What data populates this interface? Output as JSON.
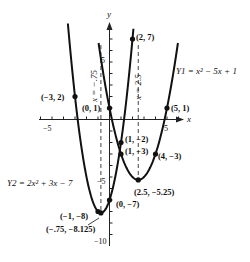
{
  "chart_data": {
    "type": "line",
    "title": "",
    "xlabel": "x",
    "ylabel": "y",
    "xlim": [
      -6,
      6
    ],
    "ylim": [
      -11,
      8.5
    ],
    "grid": false,
    "tick_labels": {
      "x": [
        {
          "value": -5,
          "label": "-5"
        },
        {
          "value": 5,
          "label": "5"
        }
      ],
      "y": [
        {
          "value": 5,
          "label": "5"
        },
        {
          "value": -5,
          "label": "-5"
        },
        {
          "value": -10,
          "label": "-10"
        }
      ]
    },
    "series": [
      {
        "name": "Y1 = x² − 5x + 1",
        "label_text": "Y1 = x² − 5x + 1",
        "formula": {
          "a": 1,
          "b": -5,
          "c": 1
        },
        "x_range": [
          -0.95,
          5.95
        ],
        "vertex": {
          "x": 2.5,
          "y": -5.25
        },
        "axis_of_symmetry": "x = 2.5"
      },
      {
        "name": "Y2 = 2x² + 3x − 7",
        "label_text": "Y2 = 2x² + 3x − 7",
        "formula": {
          "a": 2,
          "b": 3,
          "c": -7
        },
        "x_range": [
          -3.62,
          2.08
        ],
        "vertex": {
          "x": -0.75,
          "y": -8.125
        },
        "axis_of_symmetry": "x = −.75"
      }
    ],
    "points": [
      {
        "x": -3,
        "y": 2,
        "label": "(−3, 2)"
      },
      {
        "x": 0,
        "y": 1,
        "label": "(0, 1)"
      },
      {
        "x": 2,
        "y": 7,
        "label": "(2, 7)"
      },
      {
        "x": 5,
        "y": 1,
        "label": "(5, 1)"
      },
      {
        "x": 1,
        "y": -2,
        "label": "(1, −2)"
      },
      {
        "x": 1,
        "y": -3,
        "label": "(1, −3)"
      },
      {
        "x": 4,
        "y": -3,
        "label": "(4, −3)"
      },
      {
        "x": 2.5,
        "y": -5.25,
        "label": "(2.5, −5.25)"
      },
      {
        "x": 0,
        "y": -7,
        "label": "(0, −7)"
      },
      {
        "x": -1,
        "y": -8,
        "label": "(−1, −8)"
      },
      {
        "x": -0.75,
        "y": -8.125,
        "label": "(−.75, −8.125)"
      }
    ],
    "dashed_lines": [
      {
        "x": -0.75,
        "label": "x = −.75"
      },
      {
        "x": 2.5,
        "label": "x = 2.5"
      }
    ]
  },
  "labels": {
    "x_axis": "x",
    "y_axis": "y",
    "y1_equation": "Y1 = x² − 5x + 1",
    "y2_equation": "Y2 = 2x² + 3x − 7",
    "sym_left": "x = −.75",
    "sym_right": "x = 2.5",
    "tick_neg5_x": "−5",
    "tick_5_x": "5",
    "tick_5_y": "5",
    "tick_neg5_y": "−5",
    "tick_neg10_y": "−10",
    "pt_m3_2": "(−3, 2)",
    "pt_0_1": "(0, 1)",
    "pt_2_7": "(2, 7)",
    "pt_5_1": "(5, 1)",
    "pt_1_m2": "(1, −2)",
    "pt_1_m3": "(1, −3)",
    "pt_4_m3": "(4, −3)",
    "pt_25_m525": "(2.5, −5.25)",
    "pt_0_m7": "(0, −7)",
    "pt_m1_m8": "(−1, −8)",
    "pt_vertex2": "(−.75, −8.125)"
  },
  "colors": {
    "curve": "#111111",
    "axis": "#222222",
    "dashed": "#444444",
    "background": "#ffffff"
  }
}
